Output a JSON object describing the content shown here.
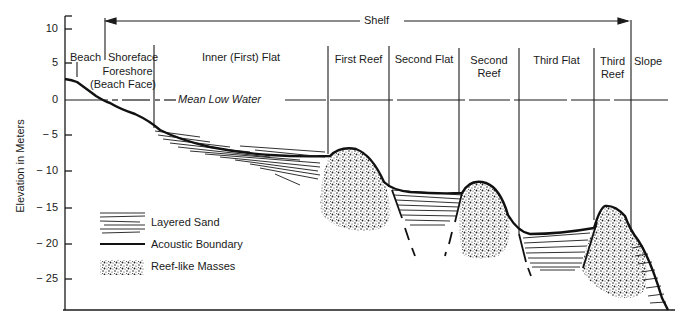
{
  "diagram": {
    "y_axis": {
      "label": "Elevation in Meters",
      "ticks": [
        "10",
        "5",
        "0",
        "−10",
        "−5",
        "−15",
        "−20",
        "−25"
      ],
      "tick_values": [
        10,
        5,
        0,
        -5,
        -10,
        -15,
        -20,
        -25
      ],
      "tick_labels": {
        "t10": "10",
        "t5": "5",
        "t0": "0",
        "tm5": "− 5",
        "tm10": "− 10",
        "tm15": "− 15",
        "tm20": "− 20",
        "tm25": "− 25"
      }
    },
    "shelf_label": "Shelf",
    "mean_low_water": "Mean Low Water",
    "zones": {
      "beach": "Beach",
      "shoreface": "Shoreface",
      "foreshore_line1": "Foreshore",
      "foreshore_line2": "(Beach Face)",
      "inner_flat": "Inner (First) Flat",
      "first_reef": "First Reef",
      "second_flat": "Second Flat",
      "second_reef_line1": "Second",
      "second_reef_line2": "Reef",
      "third_flat": "Third Flat",
      "third_reef_line1": "Third",
      "third_reef_line2": "Reef",
      "slope": "Slope"
    },
    "legend": {
      "layered_sand": "Layered Sand",
      "acoustic_boundary": "Acoustic Boundary",
      "reef_masses": "Reef-like Masses"
    }
  }
}
